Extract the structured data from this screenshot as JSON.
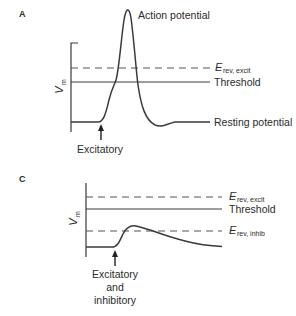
{
  "panels": [
    {
      "id": "A",
      "letter": "A",
      "y_axis_label": "V",
      "y_axis_sub": "m",
      "labels": {
        "peak": "Action potential",
        "erev_excit_main": "E",
        "erev_excit_sub": "rev, excit",
        "threshold": "Threshold",
        "resting": "Resting potential"
      },
      "stimulus": [
        "Excitatory"
      ]
    },
    {
      "id": "C",
      "letter": "C",
      "y_axis_label": "V",
      "y_axis_sub": "m",
      "labels": {
        "erev_excit_main": "E",
        "erev_excit_sub": "rev, excit",
        "threshold": "Threshold",
        "erev_inhib_main": "E",
        "erev_inhib_sub": "rev, inhib"
      },
      "stimulus": [
        "Excitatory",
        "and",
        "inhibitory"
      ]
    }
  ],
  "colors": {
    "trace": "#3a3a3a",
    "dashed": "#555555",
    "text": "#2a2a2a"
  }
}
